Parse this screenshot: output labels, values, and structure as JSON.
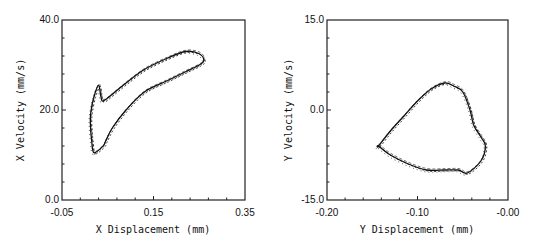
{
  "chart_data": [
    {
      "type": "scatter",
      "title": "",
      "xlabel": "X Displacement (mm)",
      "ylabel": "X Velocity (mm/s)",
      "xlim": [
        -0.05,
        0.35
      ],
      "ylim": [
        0.0,
        40.0
      ],
      "x_tick_labels": [
        "-0.05",
        "0.15",
        "0.35"
      ],
      "y_tick_labels": [
        "0.0",
        "20.0",
        "40.0"
      ],
      "grid": false,
      "legend": null,
      "description": "Phase-plane trajectory: crescent/boomerang shaped loop",
      "series": [
        {
          "name": "trajectory",
          "x": [
            0.02,
            0.015,
            0.012,
            0.013,
            0.02,
            0.03,
            0.035,
            0.04,
            0.06,
            0.09,
            0.13,
            0.18,
            0.22,
            0.25,
            0.26,
            0.25,
            0.22,
            0.18,
            0.13,
            0.09,
            0.06,
            0.045,
            0.04
          ],
          "y": [
            10.5,
            13.0,
            17.0,
            19.5,
            23.0,
            25.5,
            23.0,
            22.0,
            23.5,
            26.0,
            29.0,
            31.5,
            33.0,
            32.5,
            31.0,
            30.0,
            28.5,
            26.5,
            24.0,
            20.0,
            16.0,
            13.0,
            12.0
          ]
        }
      ]
    },
    {
      "type": "scatter",
      "title": "",
      "xlabel": "Y Displacement (mm)",
      "ylabel": "Y Velocity (mm/s)",
      "xlim": [
        -0.2,
        0.0
      ],
      "ylim": [
        -15.0,
        15.0
      ],
      "x_tick_labels": [
        "-0.20",
        "-0.10",
        "-0.00"
      ],
      "y_tick_labels": [
        "-15.0",
        "0.0",
        "15.0"
      ],
      "grid": false,
      "legend": null,
      "description": "Phase-plane trajectory: rounded triangular loop with three cusps",
      "series": [
        {
          "name": "trajectory",
          "x": [
            -0.143,
            -0.13,
            -0.115,
            -0.1,
            -0.085,
            -0.07,
            -0.06,
            -0.05,
            -0.042,
            -0.038,
            -0.03,
            -0.025,
            -0.03,
            -0.045,
            -0.055,
            -0.07,
            -0.09,
            -0.11,
            -0.13,
            -0.143
          ],
          "y": [
            -6.0,
            -3.5,
            -1.0,
            1.5,
            3.5,
            4.5,
            4.0,
            3.0,
            0.0,
            -2.5,
            -4.5,
            -6.0,
            -8.5,
            -10.5,
            -10.0,
            -10.0,
            -10.0,
            -9.0,
            -7.5,
            -6.0
          ]
        }
      ]
    }
  ]
}
